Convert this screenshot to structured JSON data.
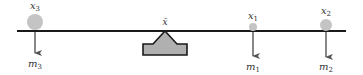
{
  "diagram": {
    "beam": {
      "color": "#1a1a1a"
    },
    "fulcrum": {
      "label": "x̄",
      "fill": "#b0b0b0",
      "stroke": "#1a1a1a"
    },
    "masses": [
      {
        "id": "m3",
        "position_label": "x",
        "position_sub": "3",
        "mass_label": "m",
        "mass_sub": "3",
        "cx": 35,
        "r": 8
      },
      {
        "id": "m1",
        "position_label": "x",
        "position_sub": "1",
        "mass_label": "m",
        "mass_sub": "1",
        "cx": 253,
        "r": 4
      },
      {
        "id": "m2",
        "position_label": "x",
        "position_sub": "2",
        "mass_label": "m",
        "mass_sub": "2",
        "cx": 326,
        "r": 6
      }
    ],
    "ball_color": "#c4c4c4",
    "arrow_color": "#555555"
  }
}
